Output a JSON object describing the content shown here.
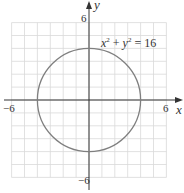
{
  "chart_data": {
    "type": "line",
    "title": "",
    "equation_label": "x² + y² = 16",
    "xlabel": "x",
    "ylabel": "y",
    "xlim": [
      -6,
      6
    ],
    "ylim": [
      -6,
      6
    ],
    "grid": true,
    "grid_step": 1,
    "tick_labels": {
      "x_min": "−6",
      "x_max": "6",
      "y_min": "−6",
      "y_max": "6"
    },
    "series": [
      {
        "name": "circle",
        "shape": "circle",
        "center": [
          0,
          0
        ],
        "radius": 4,
        "points": [
          [
            4,
            0
          ],
          [
            0,
            4
          ],
          [
            -4,
            0
          ],
          [
            0,
            -4
          ]
        ]
      }
    ]
  },
  "colors": {
    "grid": "#d9d9d9",
    "axis": "#333333",
    "curve": "#7f7f7f",
    "equation_text": "#999999"
  }
}
